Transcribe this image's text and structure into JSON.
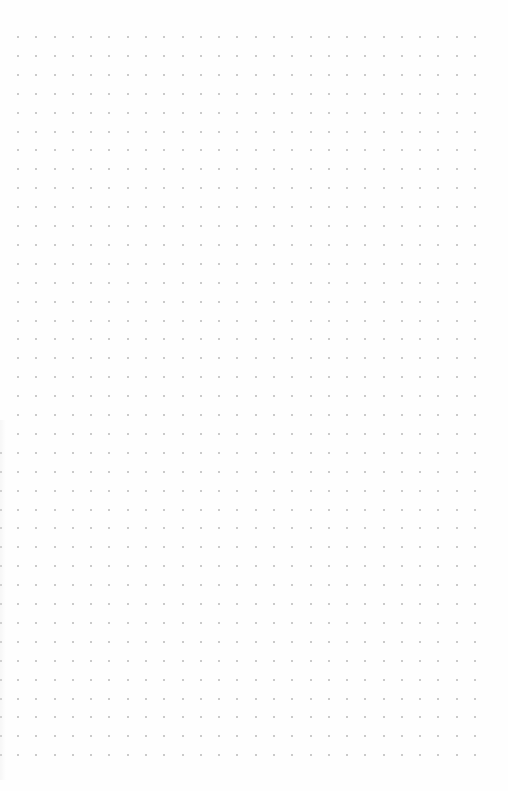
{
  "page": {
    "type": "dot-grid-paper",
    "background": "#fefefe",
    "dot_color": "#b8b8b8",
    "dot_size_px": 2
  },
  "grid": {
    "columns": 26,
    "rows": 39,
    "origin_x": 18,
    "origin_y": 37,
    "spacing_x": 18.28,
    "spacing_y": 18.9
  },
  "edge_column": {
    "x": 0,
    "start_row": 22,
    "color": "#c8c8c8"
  }
}
